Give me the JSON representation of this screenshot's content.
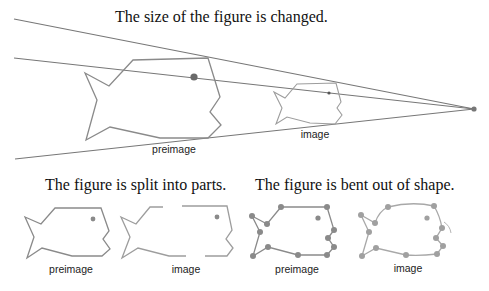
{
  "captions": {
    "dilation": "The size of the figure is changed.",
    "split": "The figure is split into parts.",
    "bent": "The figure is bent out of shape."
  },
  "labels": {
    "dilation_preimage": "preimage",
    "dilation_image": "image",
    "split_preimage": "preimage",
    "split_image": "image",
    "bent_preimage": "preimage",
    "bent_image": "image"
  },
  "colors": {
    "line": "#777777",
    "fish_dark": "#8a8a8a",
    "fish_light": "#9d9d9d",
    "point": "#8a8a8a",
    "eye_dark": "#6a6a6a"
  }
}
